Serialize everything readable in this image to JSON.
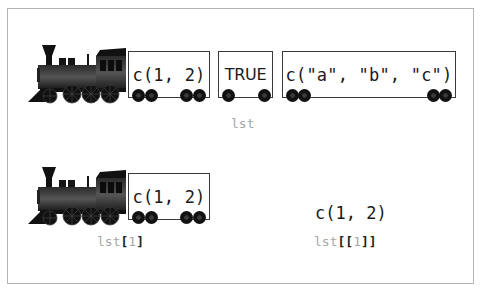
{
  "diagram": {
    "type": "train-metaphor",
    "frame_color": "#b4b4b4",
    "top_row": {
      "name": "lst",
      "engine_icon": "steam-locomotive-icon",
      "cars": [
        {
          "label": "c(1, 2)"
        },
        {
          "label": "TRUE"
        },
        {
          "label": "c(\"a\", \"b\", \"c\")"
        }
      ],
      "caption": "lst"
    },
    "bottom_left": {
      "engine_icon": "steam-locomotive-icon",
      "cars": [
        {
          "label": "c(1, 2)"
        }
      ],
      "caption": {
        "name": "lst",
        "open": "[",
        "index": "1",
        "close": "]"
      }
    },
    "bottom_right": {
      "result": "c(1, 2)",
      "caption": {
        "name": "lst",
        "open": "[[",
        "index": "1",
        "close": "]]"
      }
    },
    "colors": {
      "caption_gray": "#a8a8a8",
      "bracket_dark": "#222222",
      "text": "#1a1a1a",
      "car_border": "#3a3a3a",
      "wheel": "#111111"
    }
  }
}
